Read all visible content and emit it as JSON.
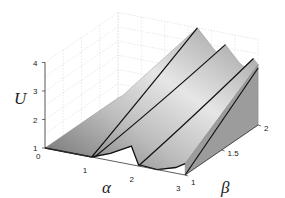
{
  "chart_data": {
    "type": "surface3d",
    "title": "",
    "xlabel": "α",
    "ylabel": "β",
    "zlabel": "U",
    "xlim": [
      0,
      3
    ],
    "ylim": [
      1,
      2
    ],
    "zlim": [
      1,
      4
    ],
    "x_ticks": [
      "0",
      "1",
      "2",
      "3"
    ],
    "y_ticks": [
      "1",
      "1.5",
      "2"
    ],
    "z_ticks": [
      "1",
      "2",
      "3",
      "4"
    ],
    "grid": true,
    "colormap": "grayscale",
    "front_edge_beta1": {
      "alpha": [
        0,
        0.5,
        1.0,
        1.4,
        1.85,
        2.0,
        2.4,
        2.8,
        3.0
      ],
      "U": [
        1.0,
        1.0,
        1.0,
        1.25,
        1.65,
        1.05,
        1.0,
        1.2,
        1.4
      ]
    },
    "ridge_lines": [
      {
        "name": "curve-1",
        "alpha_at_beta1": 1.0,
        "alpha_at_beta2": 1.7,
        "U_at_beta2": 4.0
      },
      {
        "name": "curve-2",
        "alpha_at_beta1": 1.05,
        "alpha_at_beta2": 2.3,
        "U_at_beta2": 3.6
      },
      {
        "name": "curve-3",
        "alpha_at_beta1": 2.0,
        "alpha_at_beta2": 2.9,
        "U_at_beta2": 3.3
      },
      {
        "name": "curve-4",
        "alpha_at_beta1": 3.0,
        "alpha_at_beta2": 3.0,
        "U_at_beta2": 3.0
      }
    ]
  }
}
